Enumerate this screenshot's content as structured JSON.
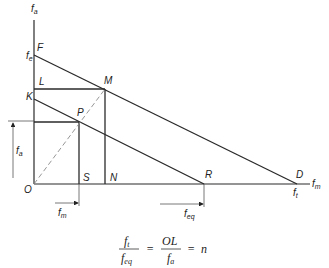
{
  "diagram": {
    "type": "goodman-diagram",
    "axes": {
      "y_axis": {
        "label": "f",
        "label_sub": "a"
      },
      "x_axis": {
        "label": "f",
        "label_sub": "m"
      }
    },
    "y_intercepts": [
      {
        "id": "fe",
        "label": "f",
        "label_sub": "e"
      }
    ],
    "x_intercepts": [
      {
        "id": "ft",
        "label": "f",
        "label_sub": "t"
      }
    ],
    "points": {
      "F": "F",
      "L": "L",
      "M": "M",
      "K": "K",
      "P": "P",
      "O": "O",
      "S": "S",
      "N": "N",
      "R": "R",
      "D": "D"
    },
    "dimensions": {
      "fa": {
        "label": "f",
        "label_sub": "a"
      },
      "fm": {
        "label": "f",
        "label_sub": "m"
      },
      "feq": {
        "label": "f",
        "label_sub": "eq"
      }
    },
    "equation": {
      "lhs_num": "f",
      "lhs_num_sub": "t",
      "lhs_den": "f",
      "lhs_den_sub": "eq",
      "eq1": "=",
      "mid_num": "OL",
      "mid_den": "f",
      "mid_den_sub": "a",
      "eq2": "=",
      "rhs": "n"
    },
    "colors": {
      "line": "#2a2a2a",
      "dashed": "#8a8a8a",
      "arrow": "#555555"
    }
  }
}
